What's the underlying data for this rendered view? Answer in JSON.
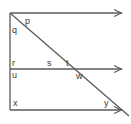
{
  "figure": {
    "type": "geometry-diagram",
    "width": 131,
    "height": 124,
    "background_color": "#ffffff",
    "stroke_color": "#5a5a5a",
    "label_color": "#3a3a3a",
    "lines": [
      {
        "name": "top-parallel-line",
        "kind": "ray",
        "x1": 10,
        "y1": 13,
        "x2": 122,
        "y2": 13,
        "arrow_end": true
      },
      {
        "name": "middle-parallel-line",
        "kind": "ray",
        "x1": 10,
        "y1": 69,
        "x2": 122,
        "y2": 69,
        "arrow_end": true
      },
      {
        "name": "bottom-parallel-line",
        "kind": "ray",
        "x1": 10,
        "y1": 110,
        "x2": 122,
        "y2": 110,
        "arrow_end": true
      },
      {
        "name": "vertical-line",
        "kind": "segment",
        "x1": 10,
        "y1": 13,
        "x2": 10,
        "y2": 110,
        "arrow_end": false
      },
      {
        "name": "transversal-line",
        "kind": "segment",
        "x1": 10,
        "y1": 13,
        "x2": 129,
        "y2": 116,
        "arrow_end": false
      }
    ],
    "labels": [
      {
        "name": "angle-label-p",
        "text": "p",
        "x": 25,
        "y": 17
      },
      {
        "name": "angle-label-q",
        "text": "q",
        "x": 12,
        "y": 26
      },
      {
        "name": "angle-label-r",
        "text": "r",
        "x": 12,
        "y": 59
      },
      {
        "name": "angle-label-s",
        "text": "s",
        "x": 47,
        "y": 59
      },
      {
        "name": "angle-label-t",
        "text": "t",
        "x": 66,
        "y": 59
      },
      {
        "name": "angle-label-u",
        "text": "u",
        "x": 12,
        "y": 71
      },
      {
        "name": "angle-label-w",
        "text": "w",
        "x": 76,
        "y": 72
      },
      {
        "name": "angle-label-x",
        "text": "x",
        "x": 13,
        "y": 99
      },
      {
        "name": "angle-label-y",
        "text": "y",
        "x": 104,
        "y": 99
      }
    ]
  }
}
